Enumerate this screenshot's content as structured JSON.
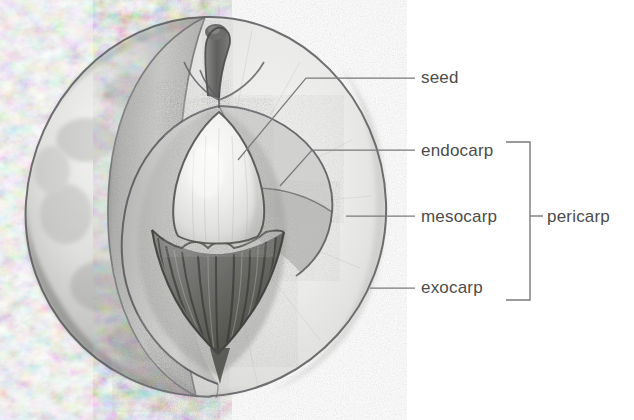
{
  "diagram": {
    "labels": {
      "seed": "seed",
      "endocarp": "endocarp",
      "mesocarp": "mesocarp",
      "exocarp": "exocarp",
      "pericarp": "pericarp"
    },
    "bracket": {
      "groups": [
        "endocarp",
        "mesocarp",
        "exocarp"
      ],
      "group_label": "pericarp"
    },
    "colors": {
      "ink": "#4c4c4c",
      "leader_line": "#6e6e6e",
      "outline": "#58585a",
      "background": "#ffffff",
      "exocarp_skin": "#d9d9d9",
      "exocarp_skin_shadow": "#9a9a9a",
      "mesocarp_flesh": "#e4e4e2",
      "mesocarp_cut": "#cfcfcd",
      "endocarp_pit": "#6f6f6d",
      "endocarp_pit_dark": "#4a4a48",
      "seed_body": "#ededea",
      "stem": "#6a6a68"
    },
    "parts": [
      {
        "name": "seed",
        "description": "pale smooth kernel inside the pit"
      },
      {
        "name": "endocarp",
        "description": "hard wrinkled stony pit enclosing the seed"
      },
      {
        "name": "mesocarp",
        "description": "fleshy middle layer, the edible pulp"
      },
      {
        "name": "exocarp",
        "description": "outer skin of the fruit"
      },
      {
        "name": "pericarp",
        "description": "collective term for endocarp, mesocarp and exocarp"
      }
    ]
  }
}
